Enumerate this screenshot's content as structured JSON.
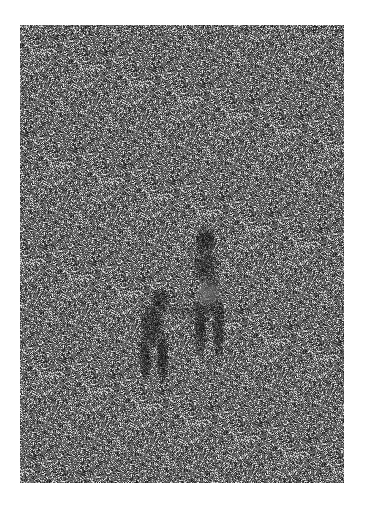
{
  "image": {
    "alt": "Grainy gray textured surface with faint dark figures near the lower center",
    "base_color": "#5a5a5a",
    "light_color": "#d8d8d8",
    "dark_color": "#1e1e1e",
    "figure_shade": "#2a2a2a",
    "highlight_shade": "#9a9a9a"
  }
}
